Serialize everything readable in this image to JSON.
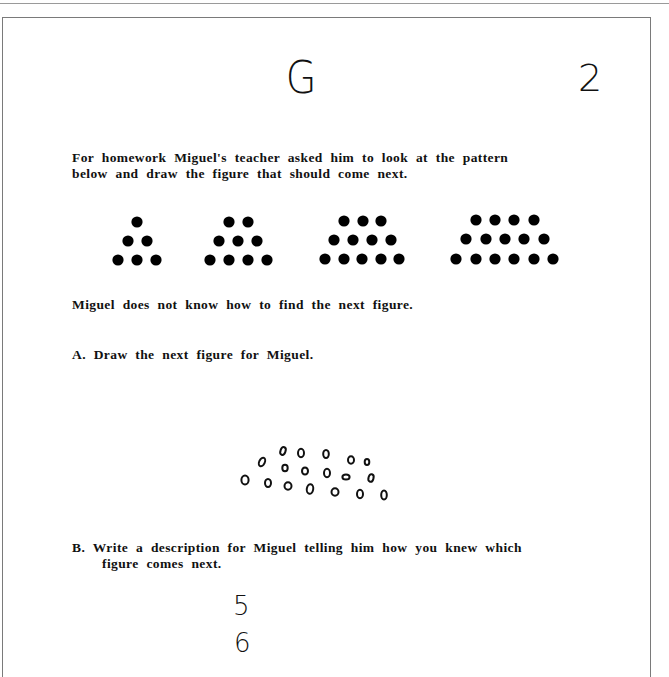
{
  "header": {
    "handwritten_letter": "G",
    "handwritten_page_number": "2"
  },
  "problem": {
    "intro_line1": "For homework Miguel's teacher asked him to look at the pattern",
    "intro_line2": "below and draw the figure that should come next.",
    "statement": "Miguel does not know how to find the next figure.",
    "question_a": "A.  Draw the next figure for Miguel.",
    "question_b_line1": "B.  Write a description for Miguel telling him how you knew which",
    "question_b_line2": "figure comes next."
  },
  "pattern": {
    "figures": [
      {
        "rows": [
          1,
          2,
          3
        ]
      },
      {
        "rows": [
          2,
          3,
          4
        ]
      },
      {
        "rows": [
          3,
          4,
          5
        ]
      },
      {
        "rows": [
          4,
          5,
          6
        ]
      }
    ],
    "dot_color": "#000000"
  },
  "student_answer": {
    "drawing_description": "hand-drawn open circles, three rows (5, 6, 7)",
    "written_answer_lines": [
      "5",
      "6"
    ]
  }
}
